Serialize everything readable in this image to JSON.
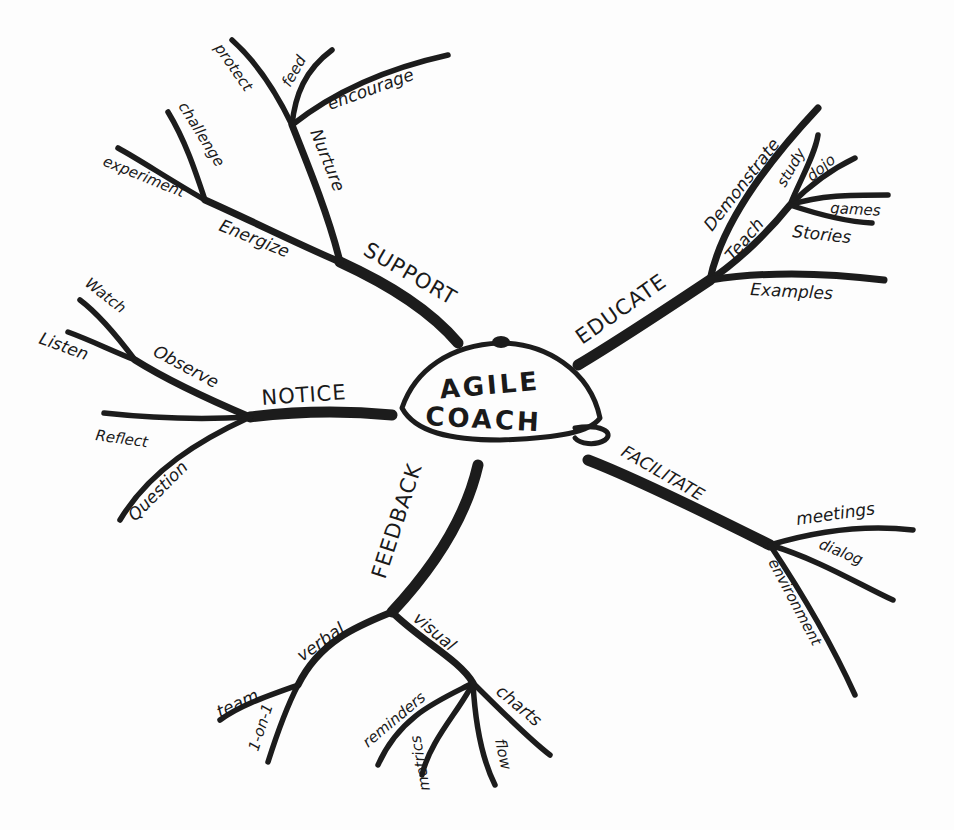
{
  "center": {
    "line1": "AGILE",
    "line2": "COACH"
  },
  "branches": {
    "support": {
      "label": "SUPPORT",
      "energize": {
        "label": "Energize",
        "leaves": [
          "experiment",
          "challenge"
        ]
      },
      "nurture": {
        "label": "Nurture",
        "leaves": [
          "protect",
          "feed",
          "encourage"
        ]
      }
    },
    "educate": {
      "label": "EDUCATE",
      "demonstrate": "Demonstrate",
      "teach": {
        "label": "Teach",
        "leaves": [
          "study",
          "dojo",
          "games",
          "Stories"
        ]
      },
      "examples": "Examples"
    },
    "notice": {
      "label": "NOTICE",
      "observe": {
        "label": "Observe",
        "leaves": [
          "Watch",
          "Listen"
        ]
      },
      "leaves": [
        "Reflect",
        "Question"
      ]
    },
    "facilitate": {
      "label": "FACILITATE",
      "leaves": [
        "meetings",
        "dialog",
        "environment"
      ]
    },
    "feedback": {
      "label": "FEEDBACK",
      "verbal": {
        "label": "verbal",
        "leaves": [
          "team",
          "1-on-1"
        ]
      },
      "visual": {
        "label": "visual",
        "leaves": [
          "reminders",
          "metrics",
          "flow",
          "charts"
        ]
      }
    }
  },
  "colors": {
    "ink": "#1c1c1c",
    "paper": "#fdfdfd"
  }
}
